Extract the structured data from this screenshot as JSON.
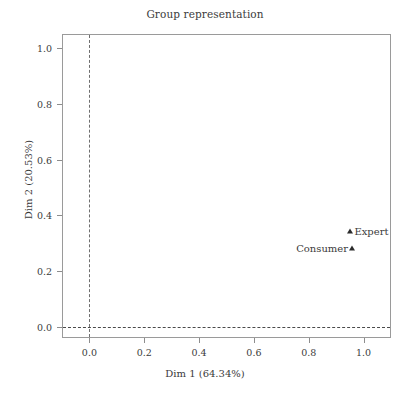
{
  "chart_data": {
    "type": "scatter",
    "title": "Group representation",
    "xlabel": "Dim 1 (64.34%)",
    "ylabel": "Dim 2 (20.53%)",
    "xlim": [
      -0.1,
      1.1
    ],
    "ylim": [
      -0.04,
      1.05
    ],
    "xticks": [
      "0.0",
      "0.2",
      "0.4",
      "0.6",
      "0.8",
      "1.0"
    ],
    "xtick_values": [
      0.0,
      0.2,
      0.4,
      0.6,
      0.8,
      1.0
    ],
    "yticks": [
      "0.0",
      "0.2",
      "0.4",
      "0.6",
      "0.8",
      "1.0"
    ],
    "ytick_values": [
      0.0,
      0.2,
      0.4,
      0.6,
      0.8,
      1.0
    ],
    "grid": false,
    "legend": "none",
    "reference_lines": [
      {
        "axis": "x",
        "value": 0.0,
        "style": "dashed"
      },
      {
        "axis": "y",
        "value": 0.0,
        "style": "dashed"
      }
    ],
    "marker": "triangle",
    "marker_color": "#2b2b2b",
    "points": [
      {
        "label": "Expert",
        "x": 0.952,
        "y": 0.342,
        "label_side": "right"
      },
      {
        "label": "Consumer",
        "x": 0.958,
        "y": 0.283,
        "label_side": "left"
      }
    ]
  },
  "colors": {
    "background": "#ffffff",
    "frame": "#9a9a9a",
    "text": "#3b3b3b",
    "reference_line": "#4a4a4a",
    "marker": "#2b2b2b"
  }
}
